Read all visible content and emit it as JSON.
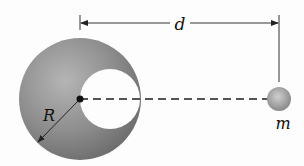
{
  "diagram": {
    "labels": {
      "distance": "d",
      "radius": "R",
      "mass": "m"
    },
    "elements": {
      "large_sphere": {
        "description": "solid sphere with spherical cavity",
        "color": "#8a8a8a"
      },
      "cavity": {
        "description": "hollow spherical cavity touching center",
        "color": "#ffffff"
      },
      "small_sphere": {
        "description": "particle of mass m",
        "color": "#999999"
      },
      "center_dot": {
        "color": "#111111"
      },
      "dashed_line": {
        "description": "line from sphere center to particle",
        "color": "#555555"
      },
      "distance_arrow": {
        "description": "double-headed arrow indicating distance d",
        "color": "#333333"
      },
      "radius_arrow": {
        "description": "arrow indicating radius R",
        "color": "#222222"
      }
    }
  }
}
